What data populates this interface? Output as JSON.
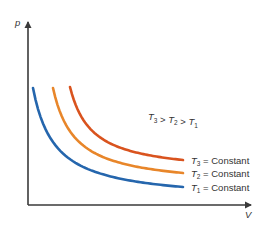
{
  "diagram": {
    "axes": {
      "y_label": "p",
      "x_label": "V",
      "axis_color": "#3a3a3a"
    },
    "relation": {
      "parts": [
        {
          "sym": "T",
          "sub": "3"
        },
        {
          "op": " > "
        },
        {
          "sym": "T",
          "sub": "2"
        },
        {
          "op": " > "
        },
        {
          "sym": "T",
          "sub": "1"
        }
      ],
      "text": "T3 > T2 > T1"
    },
    "curves": [
      {
        "id": "T3",
        "symbol": "T",
        "subscript": "3",
        "label_suffix": " = Constant",
        "label": "T3 = Constant",
        "color": "#d9531e",
        "k": 3.0
      },
      {
        "id": "T2",
        "symbol": "T",
        "subscript": "2",
        "label_suffix": " = Constant",
        "label": "T2 = Constant",
        "color": "#e8862a",
        "k": 2.0
      },
      {
        "id": "T1",
        "symbol": "T",
        "subscript": "1",
        "label_suffix": " = Constant",
        "label": "T1 = Constant",
        "color": "#2566ad",
        "k": 1.0
      }
    ]
  }
}
